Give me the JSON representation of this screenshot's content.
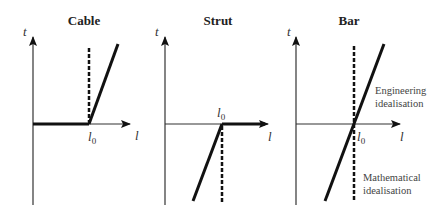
{
  "panels": [
    {
      "title": "Cable",
      "y_axis_label": "t",
      "x_axis_label": "l",
      "origin_label": "l",
      "origin_sub": "0"
    },
    {
      "title": "Strut",
      "y_axis_label": "t",
      "x_axis_label": "l",
      "origin_label": "l",
      "origin_sub": "0"
    },
    {
      "title": "Bar",
      "y_axis_label": "t",
      "x_axis_label": "l",
      "origin_label": "l",
      "origin_sub": "0",
      "annotations": {
        "engineering_1": "Engineering",
        "engineering_2": "idealisation",
        "mathematical_1": "Mathematical",
        "mathematical_2": "idealisation"
      }
    }
  ],
  "legend": {
    "solid": "Engineering idealisation",
    "dashed": "Mathematical idealisation"
  }
}
